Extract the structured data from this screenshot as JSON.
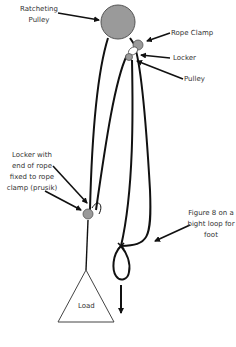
{
  "diagram": {
    "labels": {
      "ratcheting_pulley": "Ratcheting Pulley",
      "ratcheting_pulley_line1": "Ratcheting",
      "ratcheting_pulley_line2": "Pulley",
      "rope_clamp": "Rope Clamp",
      "locker": "Locker",
      "pulley": "Pulley",
      "locker_prusik_line1": "Locker with",
      "locker_prusik_line2": "end of rope",
      "locker_prusik_line3": "fixed to rope",
      "locker_prusik_line4": "clamp (prusik)",
      "figure8_line1": "Figure 8 on a",
      "figure8_line2": "bight loop for",
      "figure8_line3": "foot",
      "load": "Load"
    },
    "colors": {
      "pulley_fill": "#9a9a9a",
      "clamp_fill": "#9a9a9a",
      "rope": "#111111",
      "text": "#333333",
      "background": "#ffffff"
    }
  }
}
